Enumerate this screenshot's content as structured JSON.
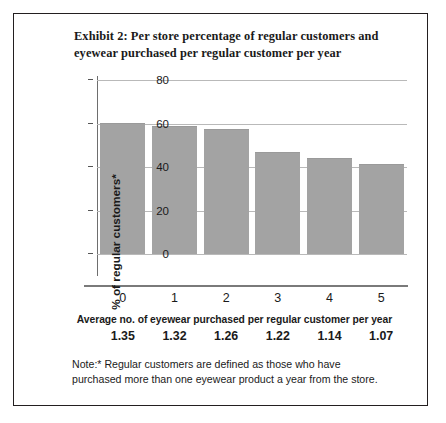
{
  "figure": {
    "title": "Exhibit 2: Per store percentage of regular customers and eyewear purchased per regular customer per year",
    "caption": "Average no. of eyewear purchased per regular customer per year",
    "note": "Note:* Regular customers are defined as those who have purchased more than one eyewear product a year from the store.",
    "bar_color": "#a3a3a3",
    "grid_color": "#b9b9b9",
    "border_color": "#231f20"
  },
  "chart_data": {
    "type": "bar",
    "title": "Exhibit 2: Per store percentage of regular customers and eyewear purchased per regular customer per year",
    "xlabel": "",
    "ylabel": "% of regular customers*",
    "categories": [
      "0",
      "1",
      "2",
      "3",
      "4",
      "5"
    ],
    "values": [
      60,
      58.5,
      57,
      46.5,
      43.5,
      41
    ],
    "secondary_series": {
      "name": "Average no. of eyewear purchased per regular customer per year",
      "values": [
        "1.35",
        "1.32",
        "1.26",
        "1.22",
        "1.14",
        "1.07"
      ]
    },
    "ylim": [
      0,
      80
    ],
    "yticks": [
      "0",
      "20",
      "40",
      "60",
      "80"
    ],
    "ytick_values": [
      0,
      20,
      40,
      60,
      80
    ],
    "grid": true,
    "legend": "none"
  }
}
